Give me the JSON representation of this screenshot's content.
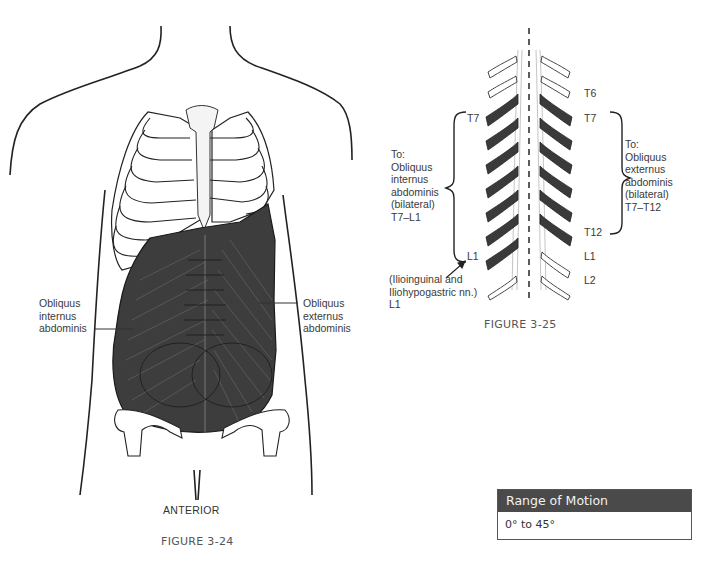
{
  "figure_24": {
    "label_left": [
      "Obliquus",
      "internus",
      "abdominis"
    ],
    "label_right": [
      "Obliquus",
      "externus",
      "abdominis"
    ],
    "view": "ANTERIOR",
    "caption": "FIGURE 3-24"
  },
  "figure_25": {
    "right_levels": [
      "T6",
      "T7",
      "T12",
      "L1",
      "L2"
    ],
    "left_levels": [
      "T7",
      "L1"
    ],
    "left_bracket_text": [
      "To:",
      "Obliquus",
      "internus",
      "abdominis",
      "(bilateral)",
      "T7–L1"
    ],
    "right_bracket_text": [
      "To:",
      "Obliquus",
      "externus",
      "abdominis",
      "(bilateral)",
      "T7–T12"
    ],
    "nerve_note": [
      "(Ilioinguinal and",
      "Iliohypogastric nn.)",
      "L1"
    ],
    "caption": "FIGURE 3-25"
  },
  "range_of_motion": {
    "title": "Range of Motion",
    "value": "0° to 45°"
  },
  "colors": {
    "muscle": "#3d3d3d",
    "rib_dark": "#3a3a3a",
    "line": "#222222",
    "box_header": "#4a4a4a"
  }
}
